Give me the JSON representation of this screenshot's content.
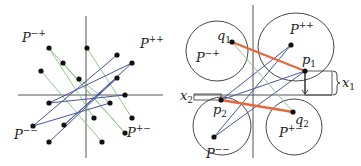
{
  "colors": {
    "green": "#8fc98a",
    "blue": "#4a55a0",
    "orange": "#e8683a",
    "axis": "#555555",
    "dot": "#111111"
  },
  "left_panel": {
    "labels": {
      "mp": {
        "base": "P",
        "sup": "−+"
      },
      "pp": {
        "base": "P",
        "sup": "++"
      },
      "mm": {
        "base": "P",
        "sup": "−−"
      },
      "pm": {
        "base": "P",
        "sup": "+−"
      }
    },
    "points": [
      [
        -37,
        47
      ],
      [
        1,
        47
      ],
      [
        -23,
        32
      ],
      [
        -45,
        24
      ],
      [
        -7,
        16
      ],
      [
        -37,
        -8
      ],
      [
        8,
        -23
      ],
      [
        -53,
        -31
      ],
      [
        -22,
        -30
      ],
      [
        -37,
        -47
      ],
      [
        31,
        40
      ],
      [
        46,
        32
      ],
      [
        31,
        17
      ],
      [
        39,
        0
      ],
      [
        24,
        -8
      ],
      [
        46,
        -23
      ],
      [
        39,
        -38
      ],
      [
        16,
        -47
      ]
    ],
    "green_edges": [
      [
        0,
        6
      ],
      [
        0,
        16
      ],
      [
        1,
        15
      ],
      [
        2,
        16
      ],
      [
        3,
        17
      ],
      [
        4,
        14
      ]
    ],
    "blue_edges": [
      [
        5,
        13
      ],
      [
        5,
        11
      ],
      [
        7,
        10
      ],
      [
        7,
        14
      ],
      [
        8,
        11
      ],
      [
        8,
        12
      ],
      [
        9,
        12
      ]
    ]
  },
  "right_panel": {
    "labels": {
      "mp": {
        "base": "P",
        "sup": "−+"
      },
      "pp": {
        "base": "P",
        "sup": "++"
      },
      "mm": {
        "base": "P",
        "sup": "−−"
      },
      "pm": {
        "base": "P",
        "sup": "+−"
      },
      "q1": {
        "base": "q",
        "sub": "1"
      },
      "q2": {
        "base": "q",
        "sub": "2"
      },
      "p1": {
        "base": "p",
        "sub": "1"
      },
      "p2": {
        "base": "p",
        "sub": "2"
      },
      "x1": {
        "base": "x",
        "sub": "1"
      },
      "x2": {
        "base": "x",
        "sub": "2"
      }
    },
    "points": {
      "q1": [
        -21,
        53
      ],
      "pp": [
        38,
        50
      ],
      "p1": [
        52,
        24
      ],
      "p2": [
        -32,
        -5
      ],
      "q2": [
        40,
        -17
      ],
      "mm": [
        -39,
        -42
      ]
    },
    "orange_edges": [
      [
        "q1",
        "p1"
      ],
      [
        "p2",
        "q2"
      ]
    ],
    "green_edges": [
      [
        "q1",
        "q2"
      ]
    ],
    "blue_edges": [
      [
        "p2",
        "pp"
      ],
      [
        "p2",
        "p1"
      ],
      [
        "mm",
        "pp"
      ],
      [
        "mm",
        "p1"
      ]
    ]
  }
}
